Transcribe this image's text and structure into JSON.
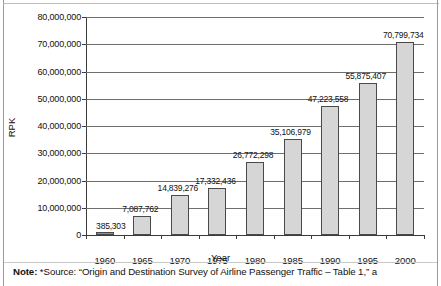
{
  "chart_data": {
    "type": "bar",
    "title": "",
    "xlabel": "Year",
    "ylabel": "RPK",
    "categories": [
      "1960",
      "1965",
      "1970",
      "1975",
      "1980",
      "1985",
      "1990",
      "1995",
      "2000"
    ],
    "values": [
      385303,
      7087762,
      14839276,
      17332436,
      26772298,
      35106979,
      47223558,
      55875407,
      70799734
    ],
    "value_labels": [
      "385,303",
      "7,087,762",
      "14,839,276",
      "17,332,436",
      "26,772,298",
      "35,106,979",
      "47,223,558",
      "55,875,407",
      "70,799,734"
    ],
    "ylim": [
      0,
      80000000
    ],
    "ytick_values": [
      0,
      10000000,
      20000000,
      30000000,
      40000000,
      50000000,
      60000000,
      70000000,
      80000000
    ],
    "ytick_labels": [
      "0",
      "10,000,000",
      "20,000,000",
      "30,000,000",
      "40,000,000",
      "50,000,000",
      "60,000,000",
      "70,000,000",
      "80,000,000"
    ],
    "grid": true,
    "legend": false,
    "bar_color": "#d6d6d6",
    "bar_edge_color": "#4a4a4a"
  },
  "note": {
    "prefix": "Note:",
    "text": "*Source: “Origin and Destination Survey of Airline Passenger Traffic – Table 1,” a"
  }
}
